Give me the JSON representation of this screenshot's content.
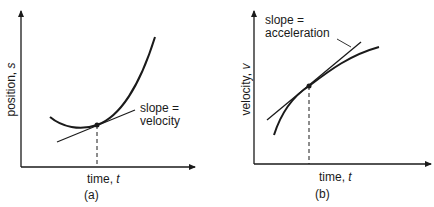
{
  "panels": [
    {
      "id": "a",
      "caption": "(a)",
      "xlabel": "time,",
      "xvar": "t",
      "ylabel": "position,",
      "yvar": "s",
      "annotation_line1": "slope =",
      "annotation_line2": "velocity"
    },
    {
      "id": "b",
      "caption": "(b)",
      "xlabel": "time,",
      "xvar": "t",
      "ylabel": "velocity,",
      "yvar": "v",
      "annotation_line1": "slope =",
      "annotation_line2": "acceleration"
    }
  ],
  "colors": {
    "ink": "#1a1a1a",
    "background": "#ffffff"
  }
}
